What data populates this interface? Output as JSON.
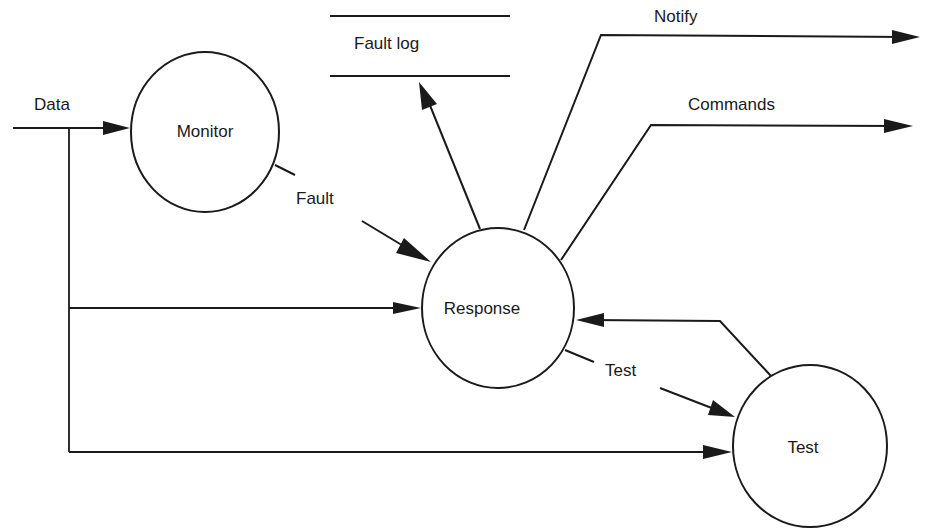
{
  "diagram": {
    "type": "data-flow-diagram",
    "processes": [
      {
        "id": "monitor",
        "label": "Monitor"
      },
      {
        "id": "response",
        "label": "Response"
      },
      {
        "id": "test",
        "label": "Test"
      }
    ],
    "data_store": {
      "id": "fault-log",
      "label": "Fault log"
    },
    "flows": [
      {
        "id": "data",
        "label": "Data",
        "from": "external",
        "to": "monitor"
      },
      {
        "id": "data-to-response",
        "label": "",
        "from": "data",
        "to": "response"
      },
      {
        "id": "data-to-test",
        "label": "",
        "from": "data",
        "to": "test"
      },
      {
        "id": "fault",
        "label": "Fault",
        "from": "monitor",
        "to": "response"
      },
      {
        "id": "log",
        "label": "",
        "from": "response",
        "to": "fault-log"
      },
      {
        "id": "notify",
        "label": "Notify",
        "from": "response",
        "to": "external"
      },
      {
        "id": "commands",
        "label": "Commands",
        "from": "response",
        "to": "external"
      },
      {
        "id": "test-request",
        "label": "Test",
        "from": "response",
        "to": "test"
      },
      {
        "id": "test-result",
        "label": "",
        "from": "test",
        "to": "response"
      }
    ],
    "colors": {
      "stroke": "#1a1a1a",
      "background": "#ffffff"
    }
  }
}
